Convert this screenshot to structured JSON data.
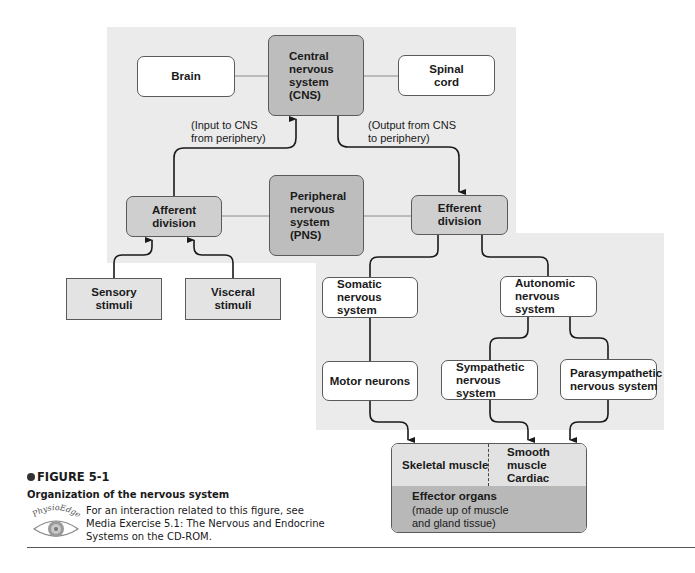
{
  "diagram": {
    "title": "Organization of the nervous system",
    "nodes": {
      "brain": "Brain",
      "cns": "Central\nnervous\nsystem\n(CNS)",
      "spinal_cord": "Spinal\ncord",
      "afferent": "Afferent\ndivision",
      "pns": "Peripheral\nnervous\nsystem\n(PNS)",
      "efferent": "Efferent\ndivision",
      "sensory": "Sensory\nstimuli",
      "visceral": "Visceral\nstimuli",
      "somatic": "Somatic\nnervous system",
      "autonomic": "Autonomic\nnervous system",
      "motor": "Motor neurons",
      "sympathetic": "Sympathetic\nnervous system",
      "parasympathetic": "Parasympathetic\nnervous system"
    },
    "notes": {
      "input": "(Input to CNS\nfrom periphery)",
      "output": "(Output from CNS\nto periphery)"
    },
    "effector": {
      "skeletal": "Skeletal muscle",
      "other": "Smooth muscle\nCardiac muscle\nGlands",
      "title": "Effector organs",
      "subtitle": "(made up of muscle\nand gland tissue)"
    },
    "colors": {
      "panel": "#ebebeb",
      "dark_box": "#bdbdbd",
      "mid_box": "#cfcfcf",
      "effector_bottom": "#b8b8b8",
      "line": "#1a1a1a"
    }
  },
  "caption": {
    "figure_label": "FIGURE 5-1",
    "title": "Organization of the nervous system",
    "logo_text": "PhysioEdge",
    "text": "For an interaction related to this figure, see\nMedia Exercise 5.1: The Nervous and Endocrine\nSystems on the CD-ROM."
  }
}
